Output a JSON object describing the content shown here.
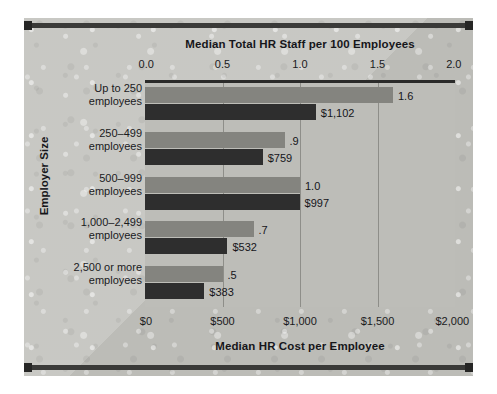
{
  "chart_data": {
    "type": "bar",
    "orientation": "horizontal",
    "title": "",
    "categories": [
      "Up to 250\nemployees",
      "250–499\nemployees",
      "500–999\nemployees",
      "1,000–2,499\nemployees",
      "2,500 or more\nemployees"
    ],
    "category_lines": [
      [
        "Up to 250",
        "employees"
      ],
      [
        "250–499",
        "employees"
      ],
      [
        "500–999",
        "employees"
      ],
      [
        "1,000–2,499",
        "employees"
      ],
      [
        "2,500 or more",
        "employees"
      ]
    ],
    "series": [
      {
        "name": "Median Total HR Staff per 100 Employees",
        "axis": "top",
        "color": "#84847f",
        "values": [
          1.6,
          0.9,
          1.0,
          0.7,
          0.5
        ],
        "labels": [
          "1.6",
          ".9",
          "1.0",
          ".7",
          ".5"
        ]
      },
      {
        "name": "Median HR Cost per Employee",
        "axis": "bottom",
        "color": "#2e2e2e",
        "values": [
          1102,
          759,
          997,
          532,
          383
        ],
        "labels": [
          "$1,102",
          "$759",
          "$997",
          "$532",
          "$383"
        ]
      }
    ],
    "top_axis": {
      "label": "Median Total HR Staff per 100 Employees",
      "ticks": [
        "0.0",
        "0.5",
        "1.0",
        "1.5",
        "2.0"
      ],
      "tick_values": [
        0.0,
        0.5,
        1.0,
        1.5,
        2.0
      ],
      "lim": [
        0.0,
        2.0
      ]
    },
    "bottom_axis": {
      "label": "Median HR Cost per Employee",
      "ticks": [
        "$0",
        "$500",
        "$1,000",
        "$1,500",
        "$2,000"
      ],
      "tick_values": [
        0,
        500,
        1000,
        1500,
        2000
      ],
      "lim": [
        0,
        2000
      ]
    },
    "ylabel": "Employer Size",
    "grid": true,
    "legend": "none",
    "colors": {
      "staff_bar": "#84847f",
      "cost_bar": "#2e2e2e",
      "plot_background": "#bdbdb8",
      "panel_background": "#c2c2bd",
      "frame_rule": "#3a3a38",
      "gridline": "#8e8e89",
      "text": "#1a1a1d"
    }
  }
}
